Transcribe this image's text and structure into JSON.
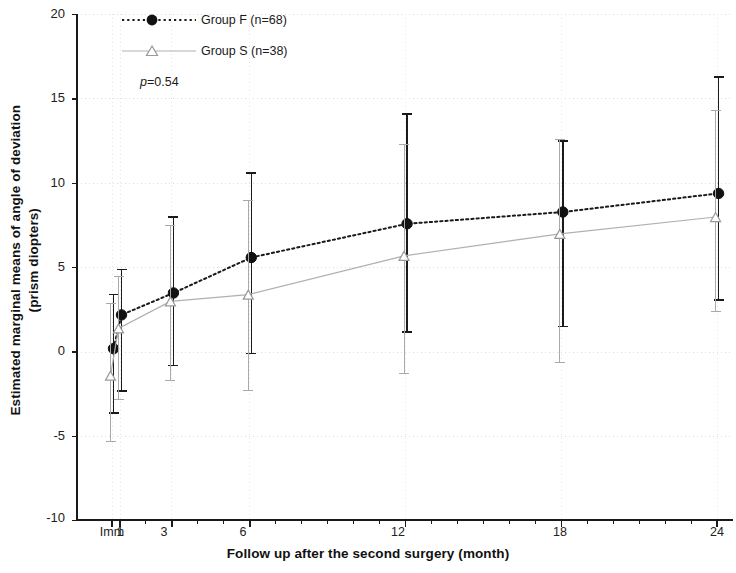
{
  "chart_data": {
    "type": "line",
    "title": "",
    "xlabel": "Follow up after the second surgery (month)",
    "ylabel": "Estimated marginal means of angle of deviation (prism diopters)",
    "ylabel_line1": "Estimated marginal means of angle of deviation",
    "ylabel_line2": "(prism diopters)",
    "categories": [
      "Imm",
      "1",
      "3",
      "6",
      "12",
      "18",
      "24"
    ],
    "x_positions": [
      0,
      1,
      3,
      6,
      12,
      18,
      24
    ],
    "xlim": [
      -0.45,
      24.6
    ],
    "ylim": [
      -10,
      20
    ],
    "yticks": [
      20,
      15,
      10,
      5,
      0,
      -5,
      -10
    ],
    "xticks": [
      "Imm",
      "1",
      "3",
      "6",
      "12",
      "18",
      "24"
    ],
    "grid": true,
    "grid_color": "#dcdcdc",
    "legend_position": "top-left",
    "annotation": "p=0.54",
    "annotation_italic_prefix": "p",
    "annotation_rest": "=0.54",
    "series": [
      {
        "name": "Group F (n=68)",
        "marker": "filled-circle",
        "color": "#1a1a1a",
        "linestyle": "dotted",
        "values": [
          0.2,
          2.2,
          3.5,
          5.6,
          7.6,
          8.3,
          9.4
        ],
        "err_low": [
          -3.6,
          -2.3,
          -0.8,
          -0.1,
          1.2,
          1.5,
          3.1
        ],
        "err_high": [
          3.4,
          4.9,
          8.0,
          10.6,
          14.1,
          12.5,
          16.3
        ]
      },
      {
        "name": "Group S (n=38)",
        "marker": "open-triangle",
        "color": "#a9a9a9",
        "linestyle": "solid-light",
        "values": [
          -1.4,
          1.4,
          3.0,
          3.4,
          5.7,
          7.0,
          8.0
        ],
        "err_low": [
          -5.3,
          -2.8,
          -1.7,
          -2.3,
          -1.3,
          -0.6,
          2.4
        ],
        "err_high": [
          2.9,
          4.5,
          7.5,
          9.0,
          12.3,
          12.6,
          14.3
        ]
      }
    ]
  },
  "legend": {
    "entries": [
      {
        "label": "Group F (n=68)",
        "marker": "filled-circle"
      },
      {
        "label": "Group S (n=38)",
        "marker": "open-triangle"
      }
    ]
  },
  "axes": {
    "y_ticks": [
      "20",
      "15",
      "10",
      "5",
      "0",
      "-5",
      "-10"
    ],
    "x_ticks": [
      "Imm",
      "1",
      "3",
      "6",
      "12",
      "18",
      "24"
    ]
  }
}
